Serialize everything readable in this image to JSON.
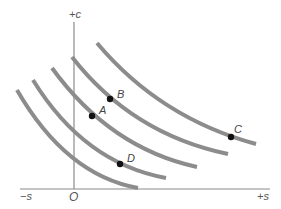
{
  "diagram": {
    "type": "indifference-curves",
    "axes": {
      "vertical_label": "+c",
      "origin_label": "O",
      "negative_horizontal_label": "−s",
      "positive_horizontal_label": "+s"
    },
    "curves": [
      {
        "id": "curve-1",
        "path": "M17,90 Q66,175 138,188"
      },
      {
        "id": "curve-2",
        "path": "M33,80 Q84,163 166,178"
      },
      {
        "id": "curve-3",
        "path": "M52,68 Q110,148 197,167"
      },
      {
        "id": "curve-4",
        "path": "M72,57 Q132,134 228,154"
      },
      {
        "id": "curve-5",
        "path": "M97,43 Q160,118 256,144"
      }
    ],
    "points": [
      {
        "label": "A",
        "x": 92,
        "y": 116,
        "lx": 99,
        "ly": 114,
        "curve": "curve-3"
      },
      {
        "label": "B",
        "x": 110,
        "y": 99,
        "lx": 117,
        "ly": 98,
        "curve": "curve-4"
      },
      {
        "label": "C",
        "x": 231,
        "y": 137,
        "lx": 234,
        "ly": 133,
        "curve": "curve-5"
      },
      {
        "label": "D",
        "x": 120,
        "y": 164,
        "lx": 127,
        "ly": 162,
        "curve": "curve-2"
      }
    ],
    "colors": {
      "curve": "#8c8c8c",
      "axis": "#8a8a8a",
      "point": "#111111"
    }
  }
}
